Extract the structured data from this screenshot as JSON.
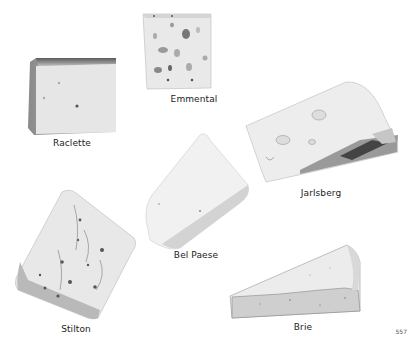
{
  "page": {
    "page_number": "557",
    "background": "#ffffff"
  },
  "cheeses": [
    {
      "name": "Raclette"
    },
    {
      "name": "Emmental"
    },
    {
      "name": "Jarlsberg"
    },
    {
      "name": "Bel Paese"
    },
    {
      "name": "Stilton"
    },
    {
      "name": "Brie"
    }
  ]
}
